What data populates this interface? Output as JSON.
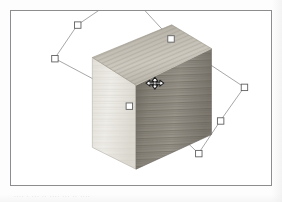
{
  "app": {
    "view_label": "3d-viewport",
    "projection": "isometric"
  },
  "scan": {
    "bottom_text_fragment": "....  .  ...  ..  ....  ...  ..  ...."
  },
  "viewport": {
    "background_color": "#ffffff",
    "border_color": "#8d8d90",
    "frame": {
      "x": 10,
      "y": 10,
      "width": 262,
      "height": 176
    }
  },
  "object": {
    "name": "wooden-box",
    "type": "rectangular-prism",
    "material": "wood-grain",
    "faces": [
      {
        "id": "top-face",
        "label": "Top",
        "fill": "#bdb8ad",
        "grain": "diagonal",
        "points": "92,57 172,24 212,48 136,85"
      },
      {
        "id": "left-face",
        "label": "Left",
        "fill": "#e9e7e1",
        "grain": "horizontal",
        "points": "92,57 136,85 136,170 92,148"
      },
      {
        "id": "right-face",
        "label": "Right",
        "fill": "#8e8a81",
        "grain": "horizontal",
        "points": "136,85 212,48 212,135 136,170"
      }
    ]
  },
  "selection": {
    "name": "rotated-bounding-box",
    "outline_color": "#9a9a9a",
    "handle_fill": "#ffffff",
    "handle_stroke": "#6a6a6a",
    "handle_size": 7,
    "outline_points": "54,62 77,28 125,-4 171,42 245,91 221,125 199,158 155,116",
    "handles": [
      {
        "id": "handle-left",
        "x": 54,
        "y": 62
      },
      {
        "id": "handle-top-left",
        "x": 77,
        "y": 28
      },
      {
        "id": "handle-top-right",
        "x": 171,
        "y": 42
      },
      {
        "id": "handle-right",
        "x": 245,
        "y": 91
      },
      {
        "id": "handle-bottom-right",
        "x": 221,
        "y": 125
      },
      {
        "id": "handle-bottom",
        "x": 199,
        "y": 158
      },
      {
        "id": "handle-center",
        "x": 129,
        "y": 110
      }
    ]
  },
  "cursor": {
    "name": "move-cursor",
    "glyph": "four-way-arrow",
    "x": 149,
    "y": 77,
    "color": "#2a2a2a"
  }
}
